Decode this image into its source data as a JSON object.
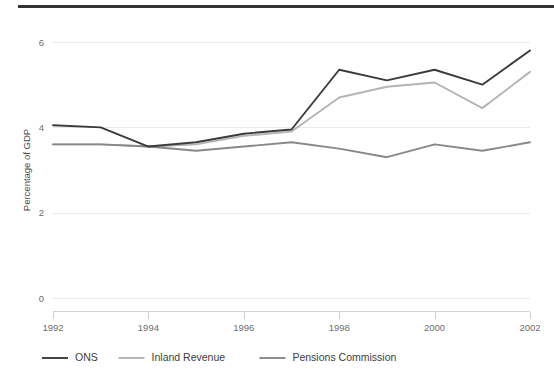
{
  "page": {
    "background_color": "#ffffff",
    "top_rule_color": "#333333"
  },
  "chart_data": {
    "type": "line",
    "title": "",
    "subtitle": "",
    "xlabel": "",
    "ylabel": "Percentage of GDP",
    "x": [
      1992,
      1993,
      1994,
      1995,
      1996,
      1997,
      1998,
      1999,
      2000,
      2001,
      2002
    ],
    "xlim": [
      1992,
      2002
    ],
    "ylim": [
      0,
      6.3
    ],
    "xticks": [
      1992,
      1994,
      1996,
      1998,
      2000,
      2002
    ],
    "xtick_labels": [
      "1992",
      "1994",
      "1996",
      "1998",
      "2000",
      "2002"
    ],
    "yticks": [
      0,
      2,
      4,
      6
    ],
    "ytick_labels": [
      "0",
      "2",
      "4",
      "6"
    ],
    "grid": "horizontal",
    "legend_position": "bottom",
    "series": [
      {
        "name": "ONS",
        "color": "#3b3b3b",
        "values": [
          4.05,
          4.0,
          3.55,
          3.65,
          3.85,
          3.95,
          5.35,
          5.1,
          5.35,
          5.0,
          5.8
        ]
      },
      {
        "name": "Inland Revenue",
        "color": "#b4b4b4",
        "values": [
          3.6,
          3.6,
          3.55,
          3.6,
          3.8,
          3.9,
          4.7,
          4.95,
          5.05,
          4.45,
          5.3
        ]
      },
      {
        "name": "Pensions Commission",
        "color": "#888888",
        "values": [
          3.6,
          3.6,
          3.55,
          3.45,
          3.55,
          3.65,
          3.5,
          3.3,
          3.6,
          3.45,
          3.65
        ]
      }
    ]
  },
  "legend": {
    "items": [
      {
        "label": "ONS",
        "color": "#3b3b3b"
      },
      {
        "label": "Inland Revenue",
        "color": "#b4b4b4"
      },
      {
        "label": "Pensions Commission",
        "color": "#888888"
      }
    ]
  },
  "axis": {
    "y_title": "Percentage of GDP"
  }
}
